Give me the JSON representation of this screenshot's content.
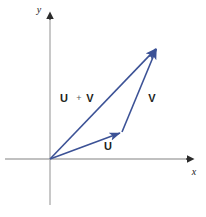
{
  "figure": {
    "background_color": "#ffffff",
    "width": 206,
    "height": 217
  },
  "axes": {
    "color": "#ababab",
    "x_axis": {
      "label": "x",
      "label_x": 194,
      "label_y": 175,
      "start_x": 5,
      "end_x": 192,
      "y": 159
    },
    "y_axis": {
      "label": "y",
      "label_x": 39,
      "label_y": 13,
      "start_y": 205,
      "end_y": 12,
      "x": 50
    },
    "origin": {
      "x": 50,
      "y": 159
    }
  },
  "vectors": {
    "color": "#3c5296",
    "stroke_width": 1.6,
    "items": [
      {
        "name": "u",
        "label": "U",
        "from": {
          "x": 50,
          "y": 159
        },
        "to": {
          "x": 122,
          "y": 132
        },
        "label_x": 108,
        "label_y": 150
      },
      {
        "name": "v",
        "label": "V",
        "from": {
          "x": 122,
          "y": 132
        },
        "to": {
          "x": 157,
          "y": 47
        },
        "label_x": 152,
        "label_y": 102
      },
      {
        "name": "u-plus-v",
        "label": "U",
        "operator": "+",
        "label2": "V",
        "from": {
          "x": 50,
          "y": 159
        },
        "to": {
          "x": 157,
          "y": 47
        },
        "label_x": 64,
        "label_y": 102,
        "operator_x": 79,
        "operator_y": 101,
        "label2_x": 89,
        "label2_y": 102
      }
    ]
  }
}
